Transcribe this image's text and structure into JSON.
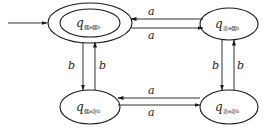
{
  "diagram": {
    "type": "finite-automaton",
    "colors": {
      "stroke": "#1a1a1a",
      "background": "#ffffff"
    },
    "states": [
      {
        "id": "even_a_even_b",
        "symbol": "q",
        "subscript": "偶a偶b",
        "start": true,
        "accepting": true,
        "position": "top-left"
      },
      {
        "id": "odd_a_even_b",
        "symbol": "q",
        "subscript": "奇a偶b",
        "start": false,
        "accepting": false,
        "position": "top-right"
      },
      {
        "id": "even_a_odd_b",
        "symbol": "q",
        "subscript": "偶a奇b",
        "start": false,
        "accepting": false,
        "position": "bottom-left"
      },
      {
        "id": "odd_a_odd_b",
        "symbol": "q",
        "subscript": "奇a奇b",
        "start": false,
        "accepting": false,
        "position": "bottom-right"
      }
    ],
    "transitions": [
      {
        "from": "odd_a_even_b",
        "to": "even_a_even_b",
        "label": "a"
      },
      {
        "from": "even_a_even_b",
        "to": "odd_a_even_b",
        "label": "a"
      },
      {
        "from": "odd_a_odd_b",
        "to": "even_a_odd_b",
        "label": "a"
      },
      {
        "from": "even_a_odd_b",
        "to": "odd_a_odd_b",
        "label": "a"
      },
      {
        "from": "even_a_even_b",
        "to": "even_a_odd_b",
        "label": "b"
      },
      {
        "from": "even_a_odd_b",
        "to": "even_a_even_b",
        "label": "b"
      },
      {
        "from": "odd_a_even_b",
        "to": "odd_a_odd_b",
        "label": "b"
      },
      {
        "from": "odd_a_odd_b",
        "to": "odd_a_even_b",
        "label": "b"
      }
    ]
  }
}
